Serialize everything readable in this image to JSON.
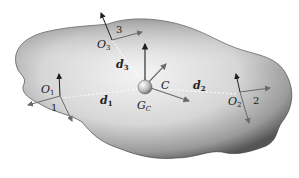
{
  "diagram": {
    "body_colors": {
      "light": "#f2f2f2",
      "mid": "#b8b8b8",
      "dark": "#4a4a4a"
    },
    "arrow_color": "#222222",
    "axis_color": "#666666",
    "frames": [
      {
        "id": "O1",
        "label": "O",
        "sub": "1",
        "number": "1"
      },
      {
        "id": "O2",
        "label": "O",
        "sub": "2",
        "number": "2"
      },
      {
        "id": "O3",
        "label": "O",
        "sub": "3",
        "number": "3"
      }
    ],
    "center": {
      "frame_label": "C",
      "point_label": "G",
      "point_sub": "C"
    },
    "vectors": [
      {
        "label": "d",
        "sub": "1"
      },
      {
        "label": "d",
        "sub": "2"
      },
      {
        "label": "d",
        "sub": "3"
      }
    ]
  }
}
